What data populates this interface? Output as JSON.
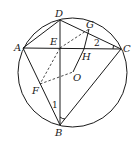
{
  "diagram": {
    "type": "geometry-circle-inscribed-quadrilateral",
    "circle": {
      "center_label": "O"
    },
    "points": [
      {
        "label": "D",
        "x": 60,
        "y": 20
      },
      {
        "label": "A",
        "x": 23,
        "y": 48
      },
      {
        "label": "C",
        "x": 121,
        "y": 49
      },
      {
        "label": "E",
        "x": 60,
        "y": 48
      },
      {
        "label": "G",
        "x": 89,
        "y": 29
      },
      {
        "label": "H",
        "x": 84,
        "y": 49
      },
      {
        "label": "O",
        "x": 73,
        "y": 72
      },
      {
        "label": "F",
        "x": 40,
        "y": 84
      },
      {
        "label": "B",
        "x": 60,
        "y": 125
      }
    ],
    "solid_segments": [
      "AD",
      "DC",
      "AC",
      "AB",
      "BC",
      "DB",
      "GH",
      "HO"
    ],
    "dashed_segments": [
      "EG",
      "EF",
      "FO"
    ],
    "angle_labels": [
      {
        "label": "1",
        "at": "B"
      },
      {
        "label": "2",
        "at": "C"
      }
    ]
  }
}
